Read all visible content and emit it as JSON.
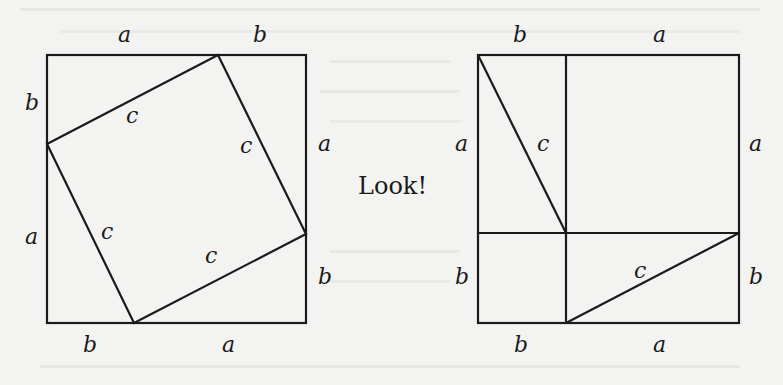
{
  "caption": "Look!",
  "colors": {
    "background": "#f3f3f1",
    "ink": "#1a1a1a",
    "bleed_through": "#dcdcda"
  },
  "left_figure": {
    "square": {
      "x": 47,
      "y": 55,
      "size": 259
    },
    "inner_square_vertices": [
      [
        218,
        55
      ],
      [
        306,
        234
      ],
      [
        134,
        323
      ],
      [
        47,
        144
      ]
    ],
    "labels": {
      "top_a": "a",
      "top_b": "b",
      "left_b": "b",
      "left_a": "a",
      "right_a": "a",
      "right_b": "b",
      "bottom_b": "b",
      "bottom_a": "a",
      "c_top": "c",
      "c_right": "c",
      "c_left": "c",
      "c_bottom": "c"
    }
  },
  "right_figure": {
    "square": {
      "x": 478,
      "y": 55,
      "size": 261
    },
    "vertical_divider_x": 566,
    "horizontal_divider_y": 233,
    "diagonals": [
      [
        [
          478,
          55
        ],
        [
          566,
          233
        ]
      ],
      [
        [
          566,
          323
        ],
        [
          739,
          233
        ]
      ]
    ],
    "labels": {
      "top_b": "b",
      "top_a": "a",
      "left_a": "a",
      "left_b": "b",
      "right_a": "a",
      "right_b": "b",
      "bottom_b": "b",
      "bottom_a": "a",
      "c_upper": "c",
      "c_lower": "c"
    }
  }
}
